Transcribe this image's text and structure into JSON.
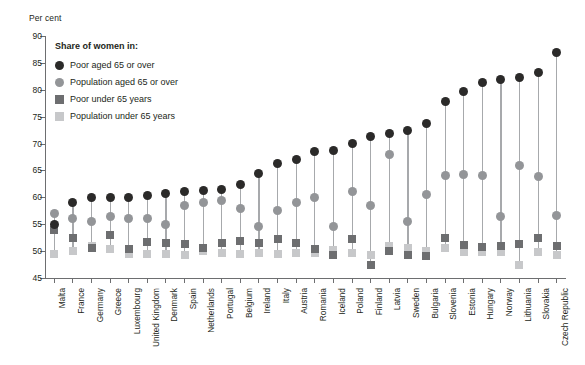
{
  "axis_unit_label": "Per cent",
  "legend": {
    "title": "Share of women in:",
    "items": [
      {
        "label": "Poor aged 65 or over",
        "shape": "circle",
        "color": "#2b2a29"
      },
      {
        "label": "Population aged 65 or over",
        "shape": "circle",
        "color": "#939598"
      },
      {
        "label": "Poor under 65 years",
        "shape": "square",
        "color": "#6d6e70"
      },
      {
        "label": "Population under 65 years",
        "shape": "square",
        "color": "#c7c8ca"
      }
    ]
  },
  "chart_data": {
    "type": "scatter",
    "title": "",
    "xlabel": "",
    "ylabel": "Per cent",
    "ylim": [
      45,
      90
    ],
    "yticks": [
      45,
      50,
      55,
      60,
      65,
      70,
      75,
      80,
      85,
      90
    ],
    "grid": false,
    "legend_position": "top-left inside",
    "categories": [
      "Malta",
      "France",
      "Germany",
      "Greece",
      "Luxembourg",
      "United Kingdom",
      "Denmark",
      "Spain",
      "Netherlands",
      "Portugal",
      "Belgium",
      "Ireland",
      "Italy",
      "Austria",
      "Romania",
      "Iceland",
      "Poland",
      "Finland",
      "Latvia",
      "Sweden",
      "Bulgaria",
      "Slovenia",
      "Estonia",
      "Hungary",
      "Norway",
      "Lithuania",
      "Slovakia",
      "Czech Republic"
    ],
    "series": [
      {
        "name": "Poor aged 65 or over",
        "shape": "circle",
        "color": "#2b2a29",
        "values": [
          55.0,
          59.0,
          60.0,
          60.0,
          60.0,
          60.3,
          60.8,
          61.0,
          61.2,
          61.4,
          62.3,
          64.5,
          66.3,
          67.0,
          68.5,
          68.7,
          70.0,
          71.3,
          71.8,
          72.4,
          73.8,
          77.8,
          79.6,
          81.4,
          82.0,
          82.3,
          83.2,
          87.0
        ]
      },
      {
        "name": "Population aged 65 or over",
        "shape": "circle",
        "color": "#939598",
        "values": [
          57.0,
          56.0,
          55.5,
          56.5,
          56.0,
          56.0,
          55.0,
          58.5,
          59.0,
          59.5,
          58.0,
          54.5,
          57.5,
          59.0,
          60.0,
          54.5,
          61.0,
          58.5,
          68.0,
          55.5,
          60.5,
          64.0,
          64.3,
          64.0,
          56.5,
          66.0,
          63.8,
          56.7
        ]
      },
      {
        "name": "Poor under 65 years",
        "shape": "square",
        "color": "#6d6e70",
        "values": [
          54.0,
          52.5,
          50.5,
          53.0,
          50.3,
          51.7,
          51.5,
          51.3,
          50.5,
          51.5,
          51.8,
          51.6,
          52.2,
          51.5,
          50.3,
          49.3,
          52.3,
          47.5,
          50.0,
          49.3,
          49.0,
          52.4,
          51.2,
          50.8,
          51.0,
          51.3,
          52.5,
          51.0
        ]
      },
      {
        "name": "Population under 65 years",
        "shape": "square",
        "color": "#c7c8ca",
        "values": [
          49.5,
          50.0,
          51.0,
          50.4,
          49.5,
          49.5,
          49.5,
          49.3,
          50.0,
          49.7,
          49.5,
          49.7,
          49.5,
          49.7,
          49.7,
          50.2,
          49.7,
          49.3,
          51.0,
          50.5,
          50.0,
          50.6,
          49.8,
          49.8,
          49.8,
          47.5,
          49.8,
          49.2
        ]
      }
    ]
  }
}
